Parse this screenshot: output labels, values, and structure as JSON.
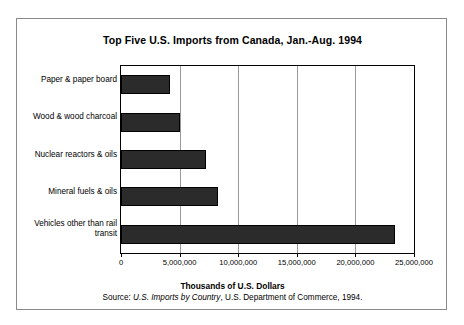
{
  "chart_data": {
    "type": "bar",
    "orientation": "horizontal",
    "title": "Top Five U.S. Imports from Canada, Jan.-Aug. 1994",
    "xlabel": "Thousands of U.S. Dollars",
    "ylabel": "",
    "xlim": [
      0,
      25000000
    ],
    "xticks": [
      0,
      5000000,
      10000000,
      15000000,
      20000000,
      25000000
    ],
    "xtick_labels": [
      "0",
      "5,000,000",
      "10,000,000",
      "15,000,000",
      "20,000,000",
      "25,000,000"
    ],
    "grid": "vertical",
    "legend": "none",
    "categories": [
      "Paper & paper board",
      "Wood & wood charcoal",
      "Nuclear reactors & oils",
      "Mineral fuels & oils",
      "Vehicles other than rail transit"
    ],
    "values": [
      4150000,
      5000000,
      7250000,
      8250000,
      23400000
    ],
    "bar_color": "#2b2b2b",
    "categories_order": "top-to-bottom"
  },
  "source": {
    "prefix": "Source: ",
    "italic_title": "U.S. Imports by Country",
    "suffix": ", U.S. Department of Commerce, 1994."
  }
}
